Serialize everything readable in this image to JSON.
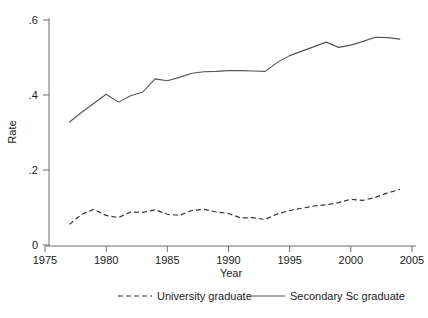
{
  "chart_data": {
    "type": "line",
    "title": "",
    "xlabel": "Year",
    "ylabel": "Rate",
    "xlim": [
      1975,
      2005
    ],
    "ylim": [
      0,
      0.6
    ],
    "grid": false,
    "legend_position": "bottom",
    "xticks": [
      1975,
      1980,
      1985,
      1990,
      1995,
      2000,
      2005
    ],
    "xtick_labels": [
      "1975",
      "1980",
      "1985",
      "1990",
      "1995",
      "2000",
      "2005"
    ],
    "yticks": [
      0,
      0.2,
      0.4,
      0.6
    ],
    "ytick_labels": [
      "0",
      ".2",
      ".4",
      ".6"
    ],
    "x": [
      1977,
      1978,
      1979,
      1980,
      1981,
      1982,
      1983,
      1984,
      1985,
      1986,
      1987,
      1988,
      1989,
      1990,
      1991,
      1992,
      1993,
      1994,
      1995,
      1996,
      1997,
      1998,
      1999,
      2000,
      2001,
      2002,
      2003,
      2004
    ],
    "series": [
      {
        "name": "University graduate",
        "style": "dashed",
        "color": "#333333",
        "values": [
          0.055,
          0.082,
          0.095,
          0.079,
          0.073,
          0.088,
          0.087,
          0.094,
          0.082,
          0.079,
          0.092,
          0.095,
          0.088,
          0.084,
          0.072,
          0.073,
          0.068,
          0.083,
          0.092,
          0.098,
          0.104,
          0.107,
          0.113,
          0.122,
          0.119,
          0.127,
          0.139,
          0.148
        ]
      },
      {
        "name": "Secondary Sc graduate",
        "style": "solid",
        "color": "#555555",
        "values": [
          0.328,
          0.354,
          0.378,
          0.402,
          0.381,
          0.398,
          0.408,
          0.443,
          0.438,
          0.447,
          0.458,
          0.462,
          0.463,
          0.465,
          0.465,
          0.464,
          0.463,
          0.487,
          0.505,
          0.517,
          0.529,
          0.541,
          0.527,
          0.533,
          0.543,
          0.554,
          0.553,
          0.549
        ]
      }
    ]
  },
  "legend": {
    "items": [
      {
        "label": "University graduate",
        "style": "dashed"
      },
      {
        "label": "Secondary Sc graduate",
        "style": "solid"
      }
    ]
  }
}
